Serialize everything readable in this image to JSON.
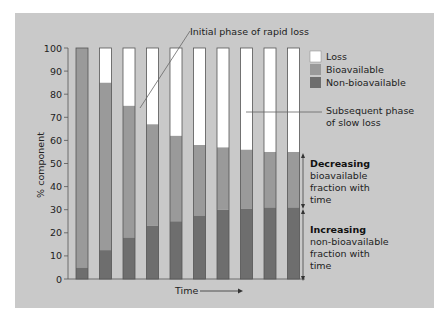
{
  "chart_data": {
    "type": "bar",
    "stacked": true,
    "title": "",
    "xlabel": "Time",
    "ylabel": "% component",
    "ylim": [
      0,
      100
    ],
    "yticks": [
      0,
      10,
      20,
      30,
      40,
      50,
      60,
      70,
      80,
      90,
      100
    ],
    "grid": false,
    "legend_position": "upper right",
    "categories": [
      "1",
      "2",
      "3",
      "4",
      "5",
      "6",
      "7",
      "8",
      "9",
      "10"
    ],
    "series": [
      {
        "name": "Non-bioavailable",
        "color": "#6e6e6e",
        "values": [
          5,
          12.5,
          18,
          23,
          25,
          27.5,
          30,
          30.5,
          31,
          31
        ]
      },
      {
        "name": "Bioavailable",
        "color": "#9a9a9a",
        "values": [
          95,
          72.5,
          57,
          44,
          37,
          30.5,
          27,
          25.5,
          24,
          24
        ]
      },
      {
        "name": "Loss",
        "color": "#ffffff",
        "values": [
          0,
          15,
          25,
          33,
          38,
          42,
          43,
          44,
          45,
          45
        ]
      }
    ],
    "annotations": [
      {
        "text": "Initial phase of rapid loss",
        "points_to": "bar 3 loss region"
      },
      {
        "text": "Subsequent phase of slow loss",
        "points_to": "bars 8-10 loss region"
      },
      {
        "text_bold": "Decreasing",
        "text": "bioavailable fraction with time",
        "bracket": "bioavailable fraction"
      },
      {
        "text_bold": "Increasing",
        "text": "non-bioavailable fraction with time",
        "bracket": "non-bioavailable fraction"
      }
    ]
  },
  "labels": {
    "xlabel": "Time",
    "ylabel": "% component",
    "legend": [
      "Loss",
      "Bioavailable",
      "Non-bioavailable"
    ],
    "ann_initial": "Initial phase of rapid loss",
    "ann_subsequent_1": "Subsequent phase",
    "ann_subsequent_2": "of slow loss",
    "ann_dec_bold": "Decreasing",
    "ann_dec_1": "bioavailable",
    "ann_dec_2": "fraction with",
    "ann_dec_3": "time",
    "ann_inc_bold": "Increasing",
    "ann_inc_1": "non-bioavailable",
    "ann_inc_2": "fraction with",
    "ann_inc_3": "time"
  }
}
